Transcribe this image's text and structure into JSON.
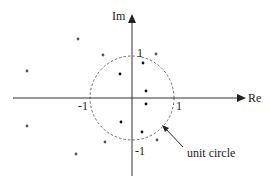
{
  "diagram": {
    "axes": {
      "x_label": "Re",
      "y_label": "Im",
      "tick_labels": {
        "im_pos": "1",
        "im_neg": "-1",
        "re_pos": "1",
        "re_neg": "-1"
      }
    },
    "annotation": {
      "text": "unit circle"
    },
    "colors": {
      "axis": "#333333",
      "circle": "#444444",
      "inner_points": "#111111",
      "outer_points": "#555555"
    },
    "points_inside_unit_circle": [
      {
        "re": 0.27,
        "im": 0.83
      },
      {
        "re": -0.29,
        "im": 0.57
      },
      {
        "re": 0.33,
        "im": 0.17
      },
      {
        "re": 0.33,
        "im": -0.14
      },
      {
        "re": -0.26,
        "im": -0.57
      },
      {
        "re": 0.24,
        "im": -0.81
      }
    ],
    "points_outside_unit_circle": [
      {
        "re": -1.29,
        "im": 1.4
      },
      {
        "re": -0.69,
        "im": 1.02
      },
      {
        "re": 0.57,
        "im": 1.05
      },
      {
        "re": -2.48,
        "im": 0.64
      },
      {
        "re": -2.48,
        "im": -0.67
      },
      {
        "re": -0.64,
        "im": -1.05
      },
      {
        "re": 0.6,
        "im": -1.0
      },
      {
        "re": -1.33,
        "im": -1.33
      }
    ]
  }
}
